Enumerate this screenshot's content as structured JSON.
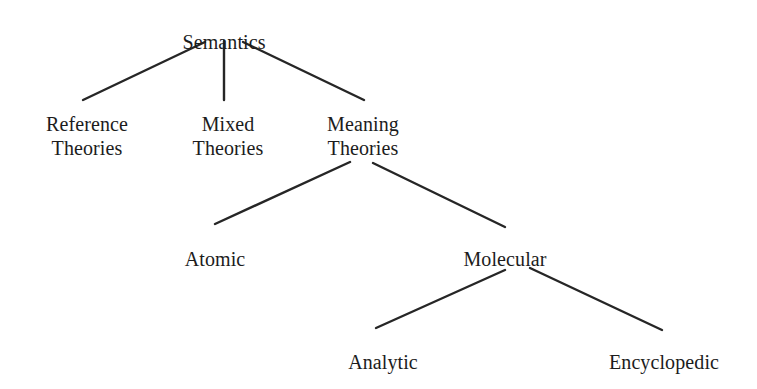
{
  "diagram": {
    "type": "tree",
    "background_color": "#ffffff",
    "text_color": "#1c1c1c",
    "edge_color": "#262626",
    "edge_width": 2.4,
    "nodes": [
      {
        "id": "semantics",
        "label": "Semantics",
        "line1": "Semantics",
        "line2": "",
        "level": 0,
        "x": 224,
        "y": 30
      },
      {
        "id": "reference-theories",
        "label": "Reference Theories",
        "line1": "Reference",
        "line2": "Theories",
        "level": 1,
        "x": 87,
        "y": 112
      },
      {
        "id": "mixed-theories",
        "label": "Mixed Theories",
        "line1": "Mixed",
        "line2": "Theories",
        "level": 1,
        "x": 228,
        "y": 112
      },
      {
        "id": "meaning-theories",
        "label": "Meaning Theories",
        "line1": "Meaning",
        "line2": "Theories",
        "level": 1,
        "x": 363,
        "y": 112
      },
      {
        "id": "atomic",
        "label": "Atomic",
        "line1": "Atomic",
        "line2": "",
        "level": 2,
        "x": 215,
        "y": 247
      },
      {
        "id": "molecular",
        "label": "Molecular",
        "line1": "Molecular",
        "line2": "",
        "level": 2,
        "x": 505,
        "y": 247
      },
      {
        "id": "analytic",
        "label": "Analytic",
        "line1": "Analytic",
        "line2": "",
        "level": 3,
        "x": 383,
        "y": 350
      },
      {
        "id": "encyclopedic",
        "label": "Encyclopedic",
        "line1": "Encyclopedic",
        "line2": "",
        "level": 3,
        "x": 664,
        "y": 350
      }
    ],
    "edges": [
      {
        "id": "semantics-reference",
        "from": "semantics",
        "to": "reference-theories",
        "x1": 205,
        "y1": 42,
        "x2": 83,
        "y2": 100
      },
      {
        "id": "semantics-mixed",
        "from": "semantics",
        "to": "mixed-theories",
        "x1": 224,
        "y1": 41,
        "x2": 224,
        "y2": 100
      },
      {
        "id": "semantics-meaning",
        "from": "semantics",
        "to": "meaning-theories",
        "x1": 243,
        "y1": 42,
        "x2": 364,
        "y2": 100
      },
      {
        "id": "meaning-atomic",
        "from": "meaning-theories",
        "to": "atomic",
        "x1": 350,
        "y1": 162,
        "x2": 215,
        "y2": 224
      },
      {
        "id": "meaning-molecular",
        "from": "meaning-theories",
        "to": "molecular",
        "x1": 373,
        "y1": 163,
        "x2": 505,
        "y2": 227
      },
      {
        "id": "molecular-analytic",
        "from": "molecular",
        "to": "analytic",
        "x1": 505,
        "y1": 270,
        "x2": 376,
        "y2": 328
      },
      {
        "id": "molecular-encyclopedic",
        "from": "molecular",
        "to": "encyclopedic",
        "x1": 530,
        "y1": 268,
        "x2": 662,
        "y2": 330
      }
    ]
  }
}
